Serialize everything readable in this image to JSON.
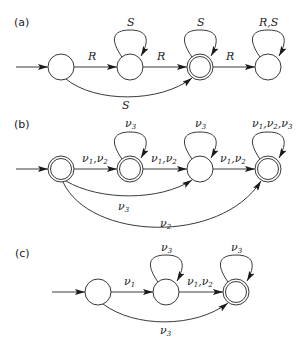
{
  "panels": [
    {
      "id": "a",
      "label": "(a)",
      "states": [
        {
          "id": "a0",
          "initial": true,
          "accepting": false
        },
        {
          "id": "a1",
          "initial": false,
          "accepting": false
        },
        {
          "id": "a2",
          "initial": false,
          "accepting": true
        },
        {
          "id": "a3",
          "initial": false,
          "accepting": false
        }
      ],
      "transitions": [
        {
          "from": "a0",
          "to": "a1",
          "label": "R"
        },
        {
          "from": "a1",
          "to": "a1",
          "label": "S"
        },
        {
          "from": "a1",
          "to": "a2",
          "label": "R"
        },
        {
          "from": "a2",
          "to": "a2",
          "label": "S"
        },
        {
          "from": "a2",
          "to": "a3",
          "label": "R"
        },
        {
          "from": "a3",
          "to": "a3",
          "label": "R,S"
        },
        {
          "from": "a0",
          "to": "a2",
          "label": "S"
        }
      ]
    },
    {
      "id": "b",
      "label": "(b)",
      "states": [
        {
          "id": "b0",
          "initial": true,
          "accepting": true
        },
        {
          "id": "b1",
          "initial": false,
          "accepting": true
        },
        {
          "id": "b2",
          "initial": false,
          "accepting": false
        },
        {
          "id": "b3",
          "initial": false,
          "accepting": true
        }
      ],
      "transitions": [
        {
          "from": "b0",
          "to": "b1",
          "label": "ν1,ν2"
        },
        {
          "from": "b1",
          "to": "b1",
          "label": "ν3"
        },
        {
          "from": "b1",
          "to": "b2",
          "label": "ν1,ν2"
        },
        {
          "from": "b2",
          "to": "b2",
          "label": "ν3"
        },
        {
          "from": "b2",
          "to": "b3",
          "label": "ν1,ν2"
        },
        {
          "from": "b3",
          "to": "b3",
          "label": "ν1,ν2,ν3"
        },
        {
          "from": "b0",
          "to": "b2",
          "label": "ν3"
        },
        {
          "from": "b0",
          "to": "b3",
          "label": "ν2"
        }
      ]
    },
    {
      "id": "c",
      "label": "(c)",
      "states": [
        {
          "id": "c0",
          "initial": true,
          "accepting": false
        },
        {
          "id": "c1",
          "initial": false,
          "accepting": false
        },
        {
          "id": "c2",
          "initial": false,
          "accepting": true
        }
      ],
      "transitions": [
        {
          "from": "c0",
          "to": "c1",
          "label": "ν1"
        },
        {
          "from": "c1",
          "to": "c1",
          "label": "ν3"
        },
        {
          "from": "c1",
          "to": "c2",
          "label": "ν1,ν2"
        },
        {
          "from": "c2",
          "to": "c2",
          "label": "ν3"
        },
        {
          "from": "c0",
          "to": "c2",
          "label": "ν3"
        }
      ]
    }
  ],
  "text": {
    "a_label": "(a)",
    "b_label": "(b)",
    "c_label": "(c)",
    "R": "R",
    "S": "S",
    "RS": "R,S",
    "nu": "ν",
    "one": "1",
    "two": "2",
    "three": "3",
    "comma": ","
  }
}
